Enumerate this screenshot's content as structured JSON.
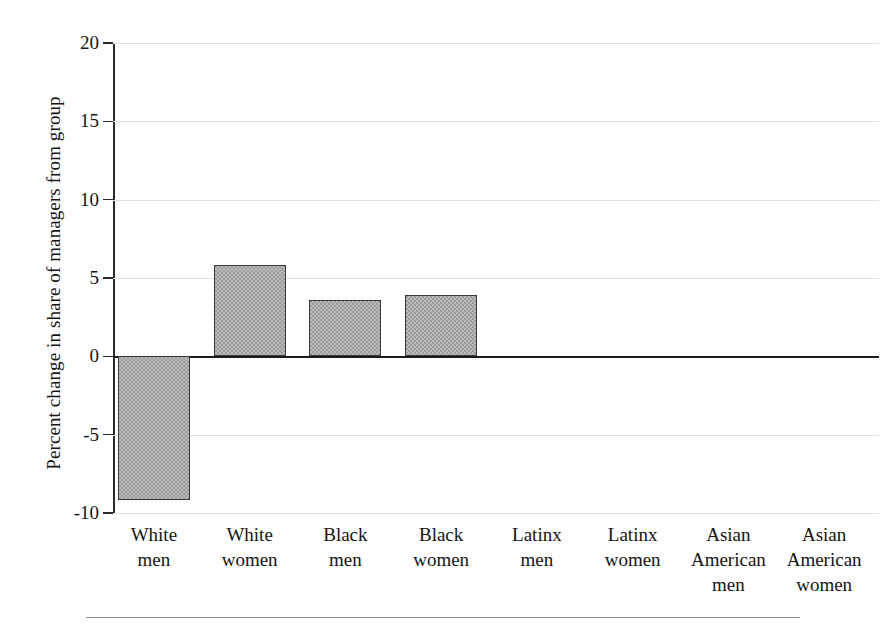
{
  "chart_data": {
    "type": "bar",
    "title": "",
    "subtitle": "",
    "xlabel": "",
    "ylabel": "Percent change in share of managers from group",
    "categories": [
      "White men",
      "White women",
      "Black men",
      "Black women",
      "Latinx men",
      "Latinx women",
      "Asian American men",
      "Asian American women"
    ],
    "category_lines": [
      [
        "White",
        "men"
      ],
      [
        "White",
        "women"
      ],
      [
        "Black",
        "men"
      ],
      [
        "Black",
        "women"
      ],
      [
        "Latinx",
        "men"
      ],
      [
        "Latinx",
        "women"
      ],
      [
        "Asian",
        "American",
        "men"
      ],
      [
        "Asian",
        "American",
        "women"
      ]
    ],
    "values": [
      -9.2,
      5.8,
      3.6,
      3.9,
      0,
      0,
      0,
      0
    ],
    "ylim": [
      -10,
      20
    ],
    "yticks": [
      20,
      15,
      10,
      5,
      0,
      -5,
      -10
    ],
    "ytick_labels": [
      "20",
      "15",
      "10",
      "5",
      "0",
      "-5",
      "-10"
    ],
    "grid": true,
    "legend": "none",
    "bar_fill_color": "#9c9c9c",
    "bar_edge_color": "#3a3a3a",
    "gridline_color": "#e2e2e2",
    "zero_line_color": "#1e1e1e",
    "axis_color": "#2a2a2a"
  }
}
